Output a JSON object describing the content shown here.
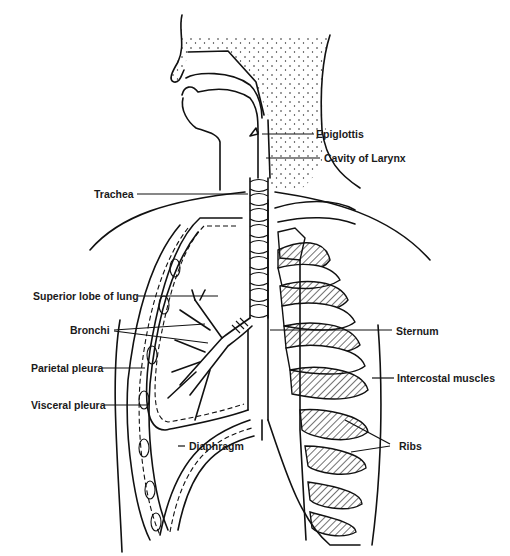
{
  "diagram": {
    "labels": {
      "epiglottis": "Epiglottis",
      "cavity_of_larynx": "Cavity of Larynx",
      "trachea": "Trachea",
      "superior_lobe": "Superior lobe of lung",
      "bronchi": "Bronchi",
      "parietal_pleura": "Parietal pleura",
      "visceral_pleura": "Visceral pleura",
      "diaphragm": "Diaphragm",
      "sternum": "Sternum",
      "intercostal_muscles": "Intercostal muscles",
      "ribs": "Ribs"
    },
    "colors": {
      "ink": "#111111",
      "background": "#ffffff"
    }
  }
}
